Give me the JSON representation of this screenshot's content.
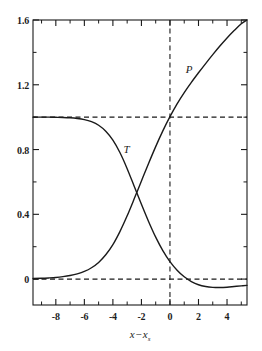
{
  "chart_data": {
    "type": "line",
    "title": "",
    "xlabel": "x - x_s",
    "xlabel_parts": {
      "var1": "x",
      "operator": "−",
      "var2": "x",
      "subscript": "s"
    },
    "ylabel": "",
    "xlim": [
      -9.6,
      5.4
    ],
    "ylim": [
      -0.16,
      1.6
    ],
    "grid": false,
    "legend_position": "inline-annotations",
    "xticks": [
      -8,
      -6,
      -4,
      -2,
      0,
      2,
      4
    ],
    "xtick_labels": [
      "-8",
      "-6",
      "-4",
      "-2",
      "0",
      "2",
      "4"
    ],
    "xminor_ticks": [
      -9,
      -7,
      -5,
      -3,
      -1,
      1,
      3,
      5
    ],
    "yticks": [
      0,
      0.4,
      0.8,
      1.2,
      1.6
    ],
    "ytick_labels": [
      "0",
      "0.4",
      "0.8",
      "1.2",
      "1.6"
    ],
    "yminor_ticks": [
      0.2,
      0.6,
      1.0,
      1.4
    ],
    "reference_lines": [
      {
        "name": "y-equals-one",
        "orientation": "horizontal",
        "value": 1.0,
        "style": "dashed"
      },
      {
        "name": "y-equals-zero",
        "orientation": "horizontal",
        "value": 0.0,
        "style": "dashed"
      },
      {
        "name": "x-equals-zero",
        "orientation": "vertical",
        "value": 0.0,
        "style": "dashed"
      }
    ],
    "annotations": [
      {
        "name": "tau-curve-label",
        "text": "T",
        "x": -3.05,
        "y": 0.805
      },
      {
        "name": "p-curve-label",
        "text": "P",
        "x": 1.35,
        "y": 1.3
      }
    ],
    "series": [
      {
        "name": "T",
        "label": "T",
        "style": "solid",
        "color": "#1a1a1a",
        "x": [
          -9.6,
          -9.0,
          -8.5,
          -8.0,
          -7.5,
          -7.0,
          -6.5,
          -6.0,
          -5.5,
          -5.0,
          -4.5,
          -4.0,
          -3.5,
          -3.0,
          -2.5,
          -2.0,
          -1.5,
          -1.0,
          -0.5,
          0.0,
          0.5,
          1.0,
          1.5,
          2.0,
          2.5,
          3.0,
          3.5,
          4.0,
          4.5,
          5.0,
          5.4
        ],
        "values": [
          1.0,
          1.0,
          1.0,
          0.999,
          0.998,
          0.996,
          0.992,
          0.985,
          0.972,
          0.95,
          0.913,
          0.858,
          0.78,
          0.682,
          0.572,
          0.462,
          0.356,
          0.259,
          0.176,
          0.108,
          0.055,
          0.014,
          -0.015,
          -0.035,
          -0.046,
          -0.051,
          -0.052,
          -0.05,
          -0.046,
          -0.042,
          -0.039
        ]
      },
      {
        "name": "P",
        "label": "P",
        "style": "solid",
        "color": "#1a1a1a",
        "x": [
          -9.6,
          -9.0,
          -8.5,
          -8.0,
          -7.5,
          -7.0,
          -6.5,
          -6.0,
          -5.5,
          -5.0,
          -4.5,
          -4.0,
          -3.5,
          -3.0,
          -2.5,
          -2.0,
          -1.5,
          -1.0,
          -0.5,
          0.0,
          0.5,
          1.0,
          1.5,
          2.0,
          2.5,
          3.0,
          3.5,
          4.0,
          4.5,
          5.0,
          5.4
        ],
        "values": [
          0.004,
          0.005,
          0.007,
          0.01,
          0.015,
          0.022,
          0.032,
          0.047,
          0.07,
          0.103,
          0.15,
          0.213,
          0.295,
          0.391,
          0.497,
          0.606,
          0.714,
          0.818,
          0.915,
          1.003,
          1.082,
          1.152,
          1.215,
          1.274,
          1.331,
          1.386,
          1.439,
          1.489,
          1.535,
          1.577,
          1.6
        ]
      }
    ]
  }
}
